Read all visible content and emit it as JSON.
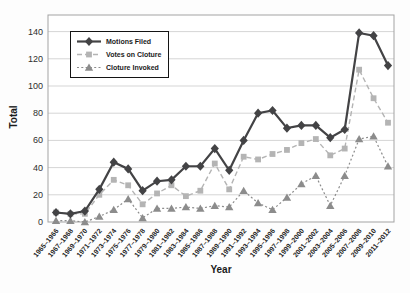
{
  "figure": {
    "xlabel": "Year",
    "ylabel": "Total"
  },
  "chart_data": {
    "type": "line",
    "title": "",
    "xlabel": "Year",
    "ylabel": "Total",
    "ylim": [
      0,
      140
    ],
    "yticks": [
      0,
      20,
      40,
      60,
      80,
      100,
      120,
      140
    ],
    "grid": true,
    "legend_position": "top-left",
    "categories": [
      "1965–1966",
      "1967–1968",
      "1969–1970",
      "1971–1972",
      "1973–1974",
      "1975–1976",
      "1977–1978",
      "1979–1980",
      "1981–1982",
      "1983–1984",
      "1985–1986",
      "1987–1988",
      "1989–1990",
      "1991–1992",
      "1993–1994",
      "1995–1996",
      "1997–1998",
      "1999–2000",
      "2001–2002",
      "2003–2004",
      "2005–2006",
      "2007–2008",
      "2009–2010",
      "2011–2012"
    ],
    "series": [
      {
        "name": "Motions Filed",
        "marker": "diamond",
        "line": "solid",
        "color": "#434345",
        "values": [
          7,
          6,
          8,
          24,
          44,
          39,
          23,
          30,
          31,
          41,
          41,
          54,
          38,
          60,
          80,
          82,
          69,
          71,
          71,
          62,
          68,
          139,
          137,
          115
        ]
      },
      {
        "name": "Votes on Cloture",
        "marker": "square",
        "line": "dashed",
        "color": "#b4b4b4",
        "values": [
          7,
          6,
          6,
          20,
          31,
          27,
          13,
          21,
          27,
          19,
          23,
          43,
          24,
          48,
          46,
          50,
          53,
          58,
          61,
          49,
          54,
          112,
          91,
          73
        ]
      },
      {
        "name": "Cloture Invoked",
        "marker": "triangle",
        "line": "dotted",
        "color": "#8c8c8c",
        "values": [
          1,
          1,
          0,
          4,
          9,
          17,
          3,
          10,
          10,
          11,
          10,
          12,
          11,
          23,
          14,
          9,
          18,
          28,
          34,
          12,
          34,
          61,
          63,
          41
        ]
      }
    ],
    "colors": {
      "gridline": "#d5d5d5",
      "plot_border": "#a3a3a3",
      "tick_text": "#2e2e2e",
      "background": "#ffffff"
    }
  }
}
